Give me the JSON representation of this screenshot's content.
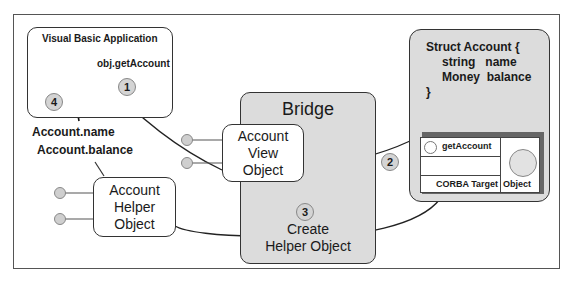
{
  "vb_app": {
    "title": "Visual Basic Application",
    "call": "obj.getAccount",
    "step1": "1",
    "step4": "4"
  },
  "properties": {
    "name": "Account.name",
    "balance": "Account.balance"
  },
  "bridge": {
    "title": "Bridge",
    "step3": "3",
    "create_line1": "Create",
    "create_line2": "Helper Object"
  },
  "account_view": {
    "line1": "Account",
    "line2": "View",
    "line3": "Object"
  },
  "account_helper": {
    "line1": "Account",
    "line2": "Helper",
    "line3": "Object"
  },
  "corba": {
    "struct_line1": "Struct Account {",
    "struct_line2": "string   name",
    "struct_line3": "Money  balance",
    "struct_line4": "}",
    "method": "getAccount",
    "target_label": "CORBA Target",
    "object_label": "Object",
    "step2": "2"
  }
}
